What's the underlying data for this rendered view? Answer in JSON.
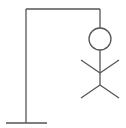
{
  "game": {
    "name": "hangman",
    "stroke_color": "#555555",
    "background": "#ffffff",
    "gallows": {
      "base": {
        "x1": 6,
        "y1": 123,
        "x2": 47,
        "y2": 123
      },
      "post": {
        "x1": 26,
        "y1": 123,
        "x2": 26,
        "y2": 9
      },
      "beam": {
        "x1": 26,
        "y1": 9,
        "x2": 100,
        "y2": 9
      },
      "rope": {
        "x1": 100,
        "y1": 9,
        "x2": 100,
        "y2": 28
      }
    },
    "figure": {
      "head": {
        "cx": 100,
        "cy": 39,
        "r": 11
      },
      "body": {
        "x1": 100,
        "y1": 50,
        "x2": 100,
        "y2": 85
      },
      "left_arm": {
        "x1": 100,
        "y1": 73,
        "x2": 81,
        "y2": 60
      },
      "right_arm": {
        "x1": 100,
        "y1": 73,
        "x2": 119,
        "y2": 60
      },
      "left_leg": {
        "x1": 100,
        "y1": 85,
        "x2": 81,
        "y2": 98
      },
      "right_leg": {
        "x1": 100,
        "y1": 85,
        "x2": 119,
        "y2": 98
      }
    }
  }
}
